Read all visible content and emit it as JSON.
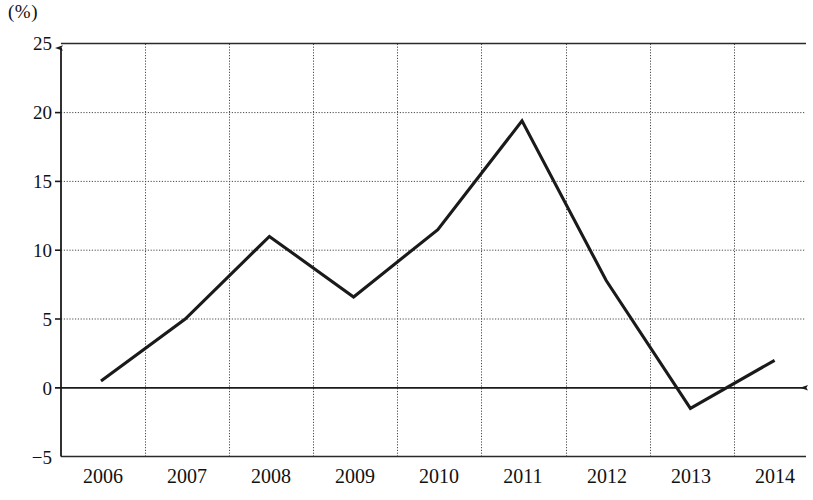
{
  "chart_data": {
    "type": "line",
    "title": "",
    "subtitle": "",
    "xlabel": "",
    "ylabel": "",
    "unit_label": "(%)",
    "categories": [
      "2006",
      "2007",
      "2008",
      "2009",
      "2010",
      "2011",
      "2012",
      "2013",
      "2014"
    ],
    "values": [
      0.5,
      5.0,
      11.0,
      6.6,
      11.5,
      19.4,
      7.8,
      -1.5,
      2.0
    ],
    "series": [
      {
        "name": "",
        "values": [
          0.5,
          5.0,
          11.0,
          6.6,
          11.5,
          19.4,
          7.8,
          -1.5,
          2.0
        ]
      }
    ],
    "ylim": [
      -5,
      25
    ],
    "ytick_labels": [
      "25",
      "20",
      "15",
      "10",
      "5",
      "0",
      "−5"
    ],
    "yticks": [
      25,
      20,
      15,
      10,
      5,
      0,
      -5
    ],
    "xtick_labels": [
      "2006",
      "2007",
      "2008",
      "2009",
      "2010",
      "2011",
      "2012",
      "2013",
      "2014"
    ],
    "grid": true,
    "grid_style": "dotted",
    "legend": "none",
    "line_color": "#1a1a1a",
    "grid_color": "#555555",
    "axis_color": "#1a1a1a",
    "background_color": "#ffffff",
    "x_axis_arrow": true,
    "y_axis_arrow": true
  }
}
